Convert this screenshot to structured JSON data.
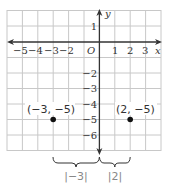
{
  "diagram": {
    "type": "coordinate-plane",
    "x_axis_label": "x",
    "y_axis_label": "y",
    "origin_label": "O",
    "x_ticks": [
      {
        "value": -5,
        "label": "−5"
      },
      {
        "value": -4,
        "label": "−4"
      },
      {
        "value": -3,
        "label": "−3"
      },
      {
        "value": -2,
        "label": "−2"
      },
      {
        "value": 1,
        "label": "1"
      },
      {
        "value": 2,
        "label": "2"
      },
      {
        "value": 3,
        "label": "3"
      }
    ],
    "y_ticks": [
      {
        "value": 1,
        "label": "1"
      },
      {
        "value": -2,
        "label": "−2"
      },
      {
        "value": -3,
        "label": "−3"
      },
      {
        "value": -4,
        "label": "−4"
      },
      {
        "value": -5,
        "label": "−5"
      },
      {
        "value": -6,
        "label": "−6"
      }
    ],
    "points": [
      {
        "x": -3,
        "y": -5,
        "label": "(−3, −5)"
      },
      {
        "x": 2,
        "y": -5,
        "label": "(2, −5)"
      }
    ],
    "braces": [
      {
        "from": -3,
        "to": 0,
        "label": "|−3|"
      },
      {
        "from": 0,
        "to": 2,
        "label": "|2|"
      }
    ],
    "colors": {
      "grid": "#c8c8c8",
      "axis": "#333333",
      "point": "#111111",
      "brace_label": "#888888"
    }
  }
}
